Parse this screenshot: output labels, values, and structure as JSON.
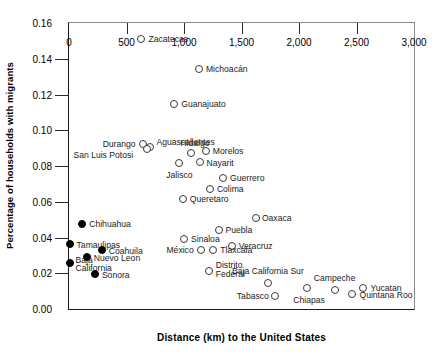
{
  "chart_data": {
    "type": "scatter",
    "title": "",
    "xlabel": "Distance (km) to the United States",
    "ylabel": "Percentage of households with migrants",
    "xlim": [
      0,
      3000
    ],
    "ylim": [
      0.0,
      0.16
    ],
    "xticks": [
      "0",
      "500",
      "1,000",
      "1,500",
      "2,000",
      "2,500",
      "3,000"
    ],
    "xtick_values": [
      0,
      500,
      1000,
      1500,
      2000,
      2500,
      3000
    ],
    "yticks": [
      "0.00",
      "0.02",
      "0.04",
      "0.06",
      "0.08",
      "0.10",
      "0.12",
      "0.14",
      "0.16"
    ],
    "ytick_values": [
      0.0,
      0.02,
      0.04,
      0.06,
      0.08,
      0.1,
      0.12,
      0.14,
      0.16
    ],
    "grid": false,
    "legend": null,
    "marker_styles": {
      "open": "open circle — interior (non-border) state",
      "filled": "filled circle — US border state"
    },
    "points": [
      {
        "label": "Zacatecas",
        "x": 630,
        "y": 0.151,
        "marker": "open",
        "lpos": "right",
        "ldx": 7,
        "ldy": 0
      },
      {
        "label": "Michoacán",
        "x": 1130,
        "y": 0.1345,
        "marker": "open",
        "lpos": "right",
        "ldx": 7,
        "ldy": 0
      },
      {
        "label": "Guanajuato",
        "x": 915,
        "y": 0.1145,
        "marker": "open",
        "lpos": "right",
        "ldx": 7,
        "ldy": 0
      },
      {
        "label": "Durango",
        "x": 640,
        "y": 0.0925,
        "marker": "open",
        "lpos": "left",
        "ldx": -7,
        "ldy": 0
      },
      {
        "label": "Aguascalientes",
        "x": 700,
        "y": 0.0905,
        "marker": "open",
        "lpos": "right",
        "ldx": 7,
        "ldy": -5
      },
      {
        "label": "San Luis Potosi",
        "x": 680,
        "y": 0.0895,
        "marker": "open",
        "lpos": "left",
        "ldx": -14,
        "ldy": 6
      },
      {
        "label": "Hidalgo",
        "x": 1060,
        "y": 0.0875,
        "marker": "open",
        "lpos": "above",
        "ldx": 4,
        "ldy": -5
      },
      {
        "label": "Morelos",
        "x": 1190,
        "y": 0.0885,
        "marker": "open",
        "lpos": "right",
        "ldx": 7,
        "ldy": 0
      },
      {
        "label": "Nayarit",
        "x": 1135,
        "y": 0.0825,
        "marker": "open",
        "lpos": "right",
        "ldx": 7,
        "ldy": 1
      },
      {
        "label": "Jalisco",
        "x": 960,
        "y": 0.0815,
        "marker": "open",
        "lpos": "below",
        "ldx": 0,
        "ldy": 8
      },
      {
        "label": "Guerrero",
        "x": 1340,
        "y": 0.0735,
        "marker": "open",
        "lpos": "right",
        "ldx": 7,
        "ldy": 0
      },
      {
        "label": "Colima",
        "x": 1225,
        "y": 0.067,
        "marker": "open",
        "lpos": "right",
        "ldx": 7,
        "ldy": 0
      },
      {
        "label": "Queretaro",
        "x": 990,
        "y": 0.0615,
        "marker": "open",
        "lpos": "right",
        "ldx": 7,
        "ldy": 0
      },
      {
        "label": "Oaxaca",
        "x": 1625,
        "y": 0.051,
        "marker": "open",
        "lpos": "right",
        "ldx": 6,
        "ldy": 0
      },
      {
        "label": "Puebla",
        "x": 1300,
        "y": 0.044,
        "marker": "open",
        "lpos": "right",
        "ldx": 7,
        "ldy": 0
      },
      {
        "label": "Sinaloa",
        "x": 1000,
        "y": 0.039,
        "marker": "open",
        "lpos": "right",
        "ldx": 7,
        "ldy": 0
      },
      {
        "label": "Veracruz",
        "x": 1415,
        "y": 0.035,
        "marker": "open",
        "lpos": "right",
        "ldx": 7,
        "ldy": 0
      },
      {
        "label": "México",
        "x": 1145,
        "y": 0.033,
        "marker": "open",
        "lpos": "left",
        "ldx": -7,
        "ldy": 0
      },
      {
        "label": "Tlaxcala",
        "x": 1255,
        "y": 0.033,
        "marker": "open",
        "lpos": "right",
        "ldx": 7,
        "ldy": 0
      },
      {
        "label": "Distrito\nFederal",
        "x": 1215,
        "y": 0.0215,
        "marker": "open",
        "lpos": "right",
        "ldx": 7,
        "ldy": -1
      },
      {
        "label": "Baja California Sur",
        "x": 1730,
        "y": 0.0145,
        "marker": "open",
        "lpos": "above",
        "ldx": 0,
        "ldy": -7
      },
      {
        "label": "Tabasco",
        "x": 1790,
        "y": 0.0075,
        "marker": "open",
        "lpos": "left",
        "ldx": -6,
        "ldy": 0
      },
      {
        "label": "Chiapas",
        "x": 2070,
        "y": 0.0115,
        "marker": "open",
        "lpos": "below",
        "ldx": 2,
        "ldy": 8
      },
      {
        "label": "Campeche",
        "x": 2310,
        "y": 0.0105,
        "marker": "open",
        "lpos": "above",
        "ldx": 0,
        "ldy": -7
      },
      {
        "label": "Yucatan",
        "x": 2560,
        "y": 0.0115,
        "marker": "open",
        "lpos": "right",
        "ldx": 7,
        "ldy": 0
      },
      {
        "label": "Quintana Roo",
        "x": 2465,
        "y": 0.0085,
        "marker": "open",
        "lpos": "right",
        "ldx": 7,
        "ldy": 1
      },
      {
        "label": "Chihuahua",
        "x": 115,
        "y": 0.0475,
        "marker": "filled",
        "lpos": "right",
        "ldx": 7,
        "ldy": 0
      },
      {
        "label": "Tamaulipas",
        "x": 5,
        "y": 0.0365,
        "marker": "filled",
        "lpos": "right",
        "ldx": 7,
        "ldy": 1
      },
      {
        "label": "Coahuila",
        "x": 285,
        "y": 0.033,
        "marker": "filled",
        "lpos": "right",
        "ldx": 7,
        "ldy": 1
      },
      {
        "label": "Nuevo Leon",
        "x": 155,
        "y": 0.029,
        "marker": "filled",
        "lpos": "right",
        "ldx": 7,
        "ldy": 1
      },
      {
        "label": "Baja\nCalifornia",
        "x": 5,
        "y": 0.026,
        "marker": "filled",
        "lpos": "right",
        "ldx": 6,
        "ldy": 2
      },
      {
        "label": "Sonora",
        "x": 225,
        "y": 0.0195,
        "marker": "filled",
        "lpos": "right",
        "ldx": 7,
        "ldy": 1
      }
    ]
  },
  "axis": {
    "x_title": "Distance (km) to the United States",
    "y_title": "Percentage of households with migrants"
  }
}
